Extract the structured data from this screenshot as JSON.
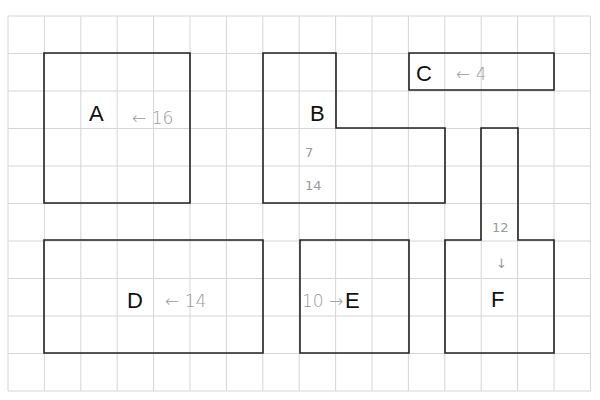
{
  "grid": {
    "x0": 8,
    "y0": 16,
    "cols": 16,
    "rows": 10,
    "cell_w": 36.4,
    "cell_h": 37.5,
    "line_color": "#d6d6d6"
  },
  "shape_color": "#222222",
  "shapes": [
    {
      "id": "A",
      "label": "A",
      "annotation": "← 16",
      "points": "44,53 190,53 190,203 44,203"
    },
    {
      "id": "B",
      "label": "B",
      "annotation_top": "7",
      "annotation_bottom": "14",
      "points": "263,53 336,53 336,128 445,128 445,203 263,203"
    },
    {
      "id": "C",
      "label": "C",
      "annotation": "← 4",
      "points": "409,53 554,53 554,90 409,90"
    },
    {
      "id": "D",
      "label": "D",
      "annotation": "← 14",
      "points": "44,240 263,240 263,353 44,353"
    },
    {
      "id": "E",
      "label": "E",
      "annotation": "10 →",
      "points": "300,240 409,240 409,353 300,353"
    },
    {
      "id": "F",
      "label": "F",
      "annotation": "12",
      "annotation_arrow": "↓",
      "points": "481,128 518,128 518,240 554,240 554,353 445,353 445,240 481,240"
    }
  ]
}
